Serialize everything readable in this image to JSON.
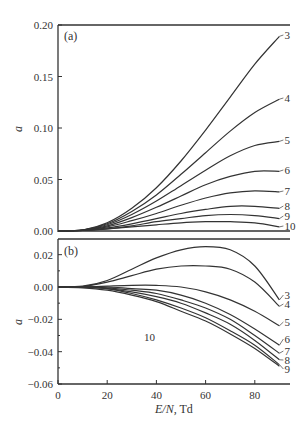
{
  "chart_data": [
    {
      "panel": "(a)",
      "type": "line",
      "xlabel": "E/N, Td",
      "ylabel": "a",
      "xlim": [
        0,
        95
      ],
      "ylim": [
        0.0,
        0.2
      ],
      "yticks": [
        "0.00",
        "0.05",
        "0.10",
        "0.15",
        "0.20"
      ],
      "xticks": [
        "0",
        "20",
        "40",
        "60",
        "80"
      ],
      "grid": false,
      "x": [
        0,
        10,
        20,
        30,
        40,
        50,
        60,
        70,
        80,
        90
      ],
      "series": [
        {
          "name": "3",
          "values": [
            0,
            0.001,
            0.008,
            0.022,
            0.042,
            0.068,
            0.098,
            0.13,
            0.162,
            0.189
          ]
        },
        {
          "name": "4",
          "values": [
            0,
            0.001,
            0.007,
            0.019,
            0.035,
            0.055,
            0.076,
            0.097,
            0.115,
            0.128
          ]
        },
        {
          "name": "5",
          "values": [
            0,
            0.001,
            0.006,
            0.016,
            0.029,
            0.044,
            0.059,
            0.073,
            0.083,
            0.087
          ]
        },
        {
          "name": "6",
          "values": [
            0,
            0.001,
            0.005,
            0.013,
            0.023,
            0.034,
            0.045,
            0.053,
            0.058,
            0.058
          ]
        },
        {
          "name": "7",
          "values": [
            0,
            0.001,
            0.004,
            0.01,
            0.017,
            0.025,
            0.032,
            0.037,
            0.039,
            0.038
          ]
        },
        {
          "name": "8",
          "values": [
            0,
            0.0005,
            0.003,
            0.007,
            0.012,
            0.017,
            0.021,
            0.024,
            0.024,
            0.022
          ]
        },
        {
          "name": "9",
          "values": [
            0,
            0.0005,
            0.002,
            0.005,
            0.009,
            0.012,
            0.015,
            0.016,
            0.015,
            0.012
          ]
        },
        {
          "name": "10",
          "values": [
            0,
            0.0005,
            0.002,
            0.004,
            0.006,
            0.008,
            0.009,
            0.009,
            0.008,
            0.004
          ]
        }
      ]
    },
    {
      "panel": "(b)",
      "type": "line",
      "xlabel": "E/N, Td",
      "ylabel": "a",
      "xlim": [
        0,
        95
      ],
      "ylim": [
        -0.06,
        0.03
      ],
      "yticks": [
        "-0.06",
        "-0.04",
        "-0.02",
        "0.00",
        "0.02"
      ],
      "xticks": [
        "0",
        "20",
        "40",
        "60",
        "80"
      ],
      "grid": false,
      "x": [
        0,
        10,
        20,
        30,
        40,
        50,
        60,
        70,
        80,
        90
      ],
      "series": [
        {
          "name": "3",
          "values": [
            0,
            0.0005,
            0.004,
            0.011,
            0.018,
            0.023,
            0.025,
            0.023,
            0.013,
            -0.008
          ]
        },
        {
          "name": "4",
          "values": [
            0,
            0.0003,
            0.003,
            0.007,
            0.011,
            0.013,
            0.013,
            0.011,
            0.003,
            -0.012
          ]
        },
        {
          "name": "5",
          "values": [
            0,
            0.0,
            0.0005,
            0.001,
            0.001,
            0.0,
            -0.003,
            -0.008,
            -0.015,
            -0.024
          ]
        },
        {
          "name": "6",
          "values": [
            0,
            0.0,
            0.0,
            -0.001,
            -0.002,
            -0.005,
            -0.01,
            -0.017,
            -0.026,
            -0.036
          ]
        },
        {
          "name": "7",
          "values": [
            0,
            0.0,
            -0.0005,
            -0.002,
            -0.004,
            -0.008,
            -0.013,
            -0.02,
            -0.03,
            -0.041
          ]
        },
        {
          "name": "8",
          "values": [
            0,
            0.0,
            -0.001,
            -0.003,
            -0.006,
            -0.01,
            -0.016,
            -0.023,
            -0.033,
            -0.045
          ]
        },
        {
          "name": "9",
          "values": [
            0,
            0.0,
            -0.001,
            -0.004,
            -0.008,
            -0.013,
            -0.019,
            -0.027,
            -0.036,
            -0.048
          ]
        },
        {
          "name": "10",
          "values": [
            0,
            -0.0005,
            -0.002,
            -0.005,
            -0.009,
            -0.015,
            -0.021,
            -0.029,
            -0.038,
            -0.049
          ]
        }
      ]
    }
  ],
  "labels": {
    "panel_a": "(a)",
    "panel_b": "(b)",
    "ylabel": "a",
    "xlabel_italic": "E/N",
    "xlabel_unit": ", Td",
    "inline_label_b_10": "10"
  }
}
